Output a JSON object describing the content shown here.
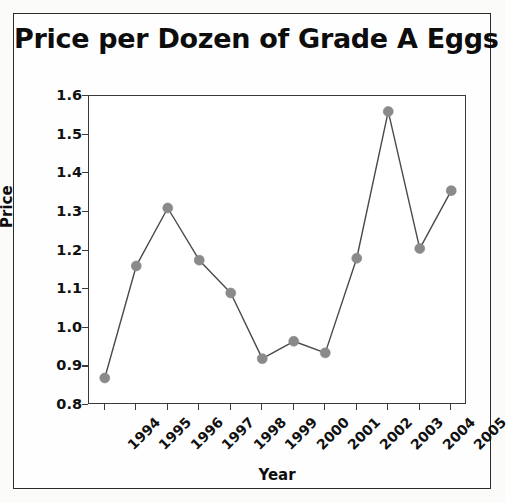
{
  "figure": {
    "title": "Price per Dozen of Grade A Eggs",
    "frame_color": "#2b2b2b",
    "background": "#fefefe"
  },
  "chart_data": {
    "type": "line",
    "title": "Price per Dozen of Grade A Eggs",
    "xlabel": "Year",
    "ylabel": "Price",
    "categories": [
      "1994",
      "1995",
      "1996",
      "1997",
      "1998",
      "1999",
      "2000",
      "2001",
      "2002",
      "2003",
      "2004",
      "2005"
    ],
    "values": [
      0.87,
      1.16,
      1.31,
      1.175,
      1.09,
      0.92,
      0.965,
      0.935,
      1.18,
      1.56,
      1.205,
      1.355
    ],
    "series": [
      {
        "name": "Price per dozen",
        "values": [
          0.87,
          1.16,
          1.31,
          1.175,
          1.09,
          0.92,
          0.965,
          0.935,
          1.18,
          1.56,
          1.205,
          1.355
        ],
        "line_color": "#4a4a4a",
        "marker_color": "#8a8a8a",
        "marker": "circle"
      }
    ],
    "ylim": [
      0.8,
      1.6
    ],
    "yticks": [
      "0.8",
      "0.9",
      "1.0",
      "1.1",
      "1.2",
      "1.3",
      "1.4",
      "1.5",
      "1.6"
    ],
    "ytick_values": [
      0.8,
      0.9,
      1.0,
      1.1,
      1.2,
      1.3,
      1.4,
      1.5,
      1.6
    ],
    "xticks": [
      "1994",
      "1995",
      "1996",
      "1997",
      "1998",
      "1999",
      "2000",
      "2001",
      "2002",
      "2003",
      "2004",
      "2005"
    ],
    "grid": false,
    "legend": null,
    "xtick_rotation": -45
  }
}
